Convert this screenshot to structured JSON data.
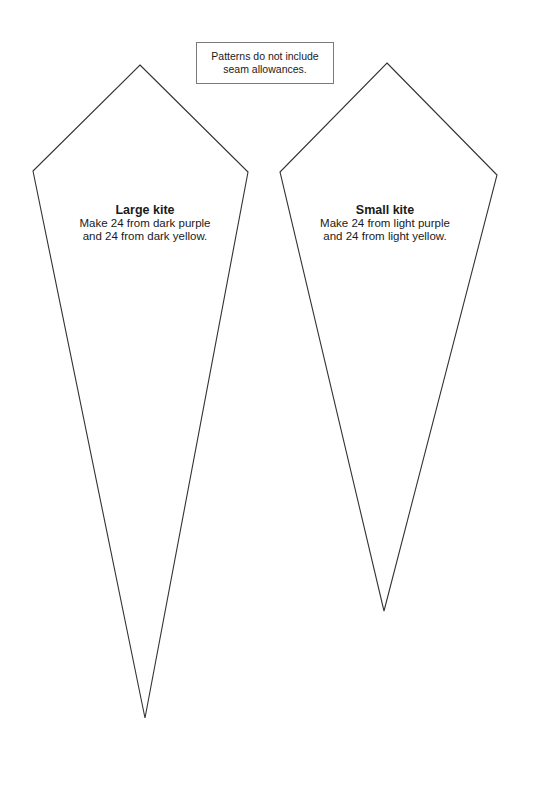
{
  "note": {
    "line1": "Patterns do not include",
    "line2": "seam allowances."
  },
  "templates": [
    {
      "name": "Large kite",
      "line1": "Make 24 from dark purple",
      "line2": "and 24 from dark yellow.",
      "stroke": "#333333"
    },
    {
      "name": "Small kite",
      "line1": "Make 24 from light purple",
      "line2": "and 24 from light yellow.",
      "stroke": "#333333"
    }
  ]
}
